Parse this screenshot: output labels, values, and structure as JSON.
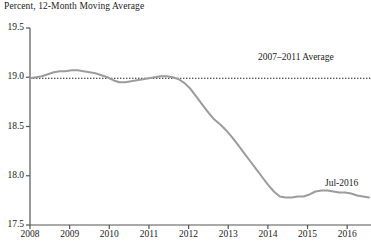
{
  "chart_data": {
    "type": "line",
    "title": "Percent, 12-Month Moving Average",
    "xlabel": "",
    "ylabel": "",
    "ylim": [
      17.5,
      19.5
    ],
    "xlim": [
      2008.0,
      2016.6
    ],
    "grid": false,
    "legend": null,
    "yticks": [
      "19.5",
      "19.0",
      "18.5",
      "18.0",
      "17.5"
    ],
    "ytick_values": [
      19.5,
      19.0,
      18.5,
      18.0,
      17.5
    ],
    "xticks": [
      "2008",
      "2009",
      "2010",
      "2011",
      "2012",
      "2013",
      "2014",
      "2015",
      "2016"
    ],
    "xtick_values": [
      2008,
      2009,
      2010,
      2011,
      2012,
      2013,
      2014,
      2015,
      2016
    ],
    "annotations": [
      {
        "name": "average-line-label",
        "text": "2007–2011 Average",
        "x": 2014.2,
        "y": 19.12
      },
      {
        "name": "last-point-label",
        "text": "Jul-2016",
        "x": 2016.0,
        "y": 17.93
      }
    ],
    "reference_line": {
      "label": "2007–2011 Average",
      "value": 18.99,
      "style": "dotted",
      "color": "#1a1a1a"
    },
    "series": [
      {
        "name": "12-Month Moving Average",
        "color": "#9c9c9c",
        "x": [
          2008.0,
          2008.15,
          2008.3,
          2008.45,
          2008.6,
          2008.75,
          2008.9,
          2009.05,
          2009.2,
          2009.35,
          2009.5,
          2009.65,
          2009.8,
          2009.95,
          2010.1,
          2010.25,
          2010.4,
          2010.55,
          2010.7,
          2010.85,
          2011.0,
          2011.15,
          2011.3,
          2011.45,
          2011.6,
          2011.75,
          2011.9,
          2012.05,
          2012.2,
          2012.35,
          2012.5,
          2012.65,
          2012.8,
          2012.95,
          2013.1,
          2013.25,
          2013.4,
          2013.55,
          2013.7,
          2013.85,
          2014.0,
          2014.15,
          2014.3,
          2014.45,
          2014.6,
          2014.75,
          2014.9,
          2015.05,
          2015.2,
          2015.35,
          2015.5,
          2015.65,
          2015.8,
          2015.95,
          2016.1,
          2016.25,
          2016.4,
          2016.55
        ],
        "y": [
          18.99,
          19.0,
          19.01,
          19.03,
          19.05,
          19.06,
          19.06,
          19.07,
          19.07,
          19.06,
          19.05,
          19.04,
          19.02,
          19.0,
          18.97,
          18.95,
          18.95,
          18.96,
          18.97,
          18.98,
          18.99,
          19.0,
          19.01,
          19.01,
          19.0,
          18.98,
          18.94,
          18.88,
          18.8,
          18.72,
          18.64,
          18.57,
          18.52,
          18.46,
          18.39,
          18.31,
          18.23,
          18.15,
          18.07,
          17.99,
          17.91,
          17.84,
          17.79,
          17.78,
          17.78,
          17.79,
          17.79,
          17.81,
          17.84,
          17.85,
          17.85,
          17.84,
          17.83,
          17.83,
          17.82,
          17.8,
          17.79,
          17.78
        ]
      }
    ]
  }
}
